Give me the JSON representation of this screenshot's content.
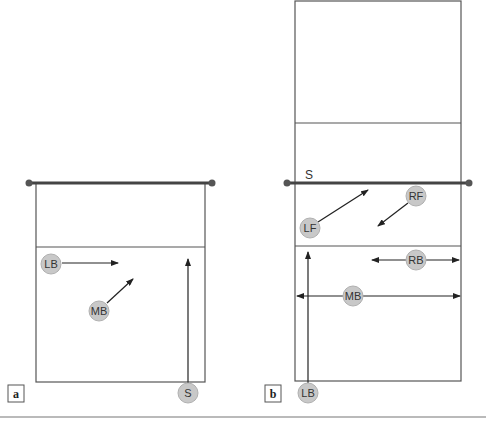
{
  "panels": [
    {
      "label": "a",
      "players": [
        {
          "id": "LB",
          "label": "LB"
        },
        {
          "id": "MB",
          "label": "MB"
        },
        {
          "id": "S",
          "label": "S"
        }
      ]
    },
    {
      "label": "b",
      "net_label": "S",
      "players": [
        {
          "id": "LF",
          "label": "LF"
        },
        {
          "id": "RF",
          "label": "RF"
        },
        {
          "id": "RB",
          "label": "RB"
        },
        {
          "id": "MB",
          "label": "MB"
        },
        {
          "id": "LB",
          "label": "LB"
        }
      ]
    }
  ],
  "colors": {
    "player_fill": "#c8c8c8",
    "line": "#555555",
    "net": "#444444"
  }
}
